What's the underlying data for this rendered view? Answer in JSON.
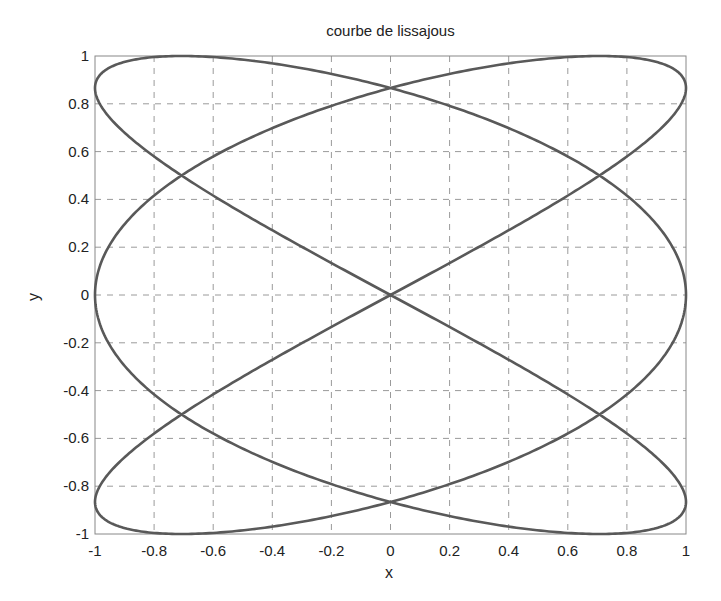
{
  "chart_data": {
    "type": "line",
    "title": "courbe de lissajous",
    "xlabel": "x",
    "ylabel": "y",
    "xlim": [
      -1,
      1
    ],
    "ylim": [
      -1,
      1
    ],
    "grid": true,
    "legend": null,
    "xticks": [
      "-1",
      "-0.8",
      "-0.6",
      "-0.4",
      "-0.2",
      "0",
      "0.2",
      "0.4",
      "0.6",
      "0.8",
      "1"
    ],
    "yticks": [
      "-1",
      "-0.8",
      "-0.6",
      "-0.4",
      "-0.2",
      "0",
      "0.2",
      "0.4",
      "0.6",
      "0.8",
      "1"
    ],
    "series": [
      {
        "name": "lissajous",
        "parametric": {
          "x": "sin(3t)",
          "y": "sin(2t)",
          "t_range": [
            0,
            6.2832
          ]
        },
        "color": "#595959",
        "key_points": [
          {
            "x": 0,
            "y": 0
          },
          {
            "x": 0,
            "y": 0.866
          },
          {
            "x": 0,
            "y": -0.866
          },
          {
            "x": 0.707,
            "y": 0.5
          },
          {
            "x": -0.707,
            "y": 0.5
          },
          {
            "x": 0.707,
            "y": -0.5
          },
          {
            "x": -0.707,
            "y": -0.5
          },
          {
            "x": 1,
            "y": 0.866
          },
          {
            "x": 1,
            "y": 0
          },
          {
            "x": 1,
            "y": -0.866
          },
          {
            "x": -1,
            "y": 0.866
          },
          {
            "x": -1,
            "y": 0
          },
          {
            "x": -1,
            "y": -0.866
          }
        ]
      }
    ]
  },
  "colors": {
    "curve": "#595959",
    "axes": "#888888",
    "grid": "#9a9a9a",
    "text": "#222222"
  }
}
